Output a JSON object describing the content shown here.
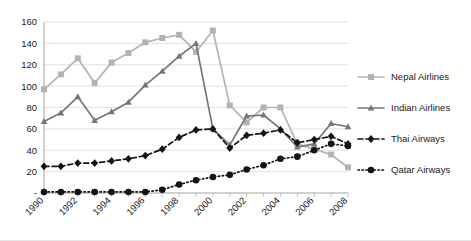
{
  "chart_data": {
    "type": "line",
    "title": "",
    "subtitle": "",
    "xlabel": "",
    "ylabel": "",
    "x": [
      1990,
      1991,
      1992,
      1993,
      1994,
      1995,
      1996,
      1997,
      1998,
      1999,
      2000,
      2001,
      2002,
      2003,
      2004,
      2005,
      2006,
      2007,
      2008
    ],
    "tick_labels": [
      "1990",
      "1992",
      "1994",
      "1996",
      "1998",
      "2000",
      "2002",
      "2004",
      "2006",
      "2008"
    ],
    "ytick_labels": [
      "-",
      "20",
      "40",
      "60",
      "80",
      "100",
      "120",
      "140",
      "160"
    ],
    "ylim": [
      0,
      160
    ],
    "xlim": [
      1990,
      2008
    ],
    "grid": true,
    "legend_position": "right",
    "series": [
      {
        "name": "Nepal Airlines",
        "color": "#b3b3b3",
        "marker": "square",
        "dash": "solid",
        "values": [
          97,
          111,
          126,
          103,
          122,
          131,
          141,
          145,
          148,
          132,
          152,
          82,
          66,
          80,
          80,
          46,
          41,
          36,
          24
        ]
      },
      {
        "name": "Indian Airlines",
        "color": "#767676",
        "marker": "triangle",
        "dash": "solid",
        "values": [
          67,
          75,
          90,
          68,
          76,
          85,
          101,
          114,
          128,
          140,
          60,
          45,
          72,
          73,
          60,
          43,
          46,
          65,
          62
        ]
      },
      {
        "name": "Thai Airways",
        "color": "#141414",
        "marker": "diamond",
        "dash": "dashed",
        "values": [
          25,
          25,
          28,
          28,
          30,
          32,
          35,
          41,
          52,
          59,
          60,
          42,
          54,
          56,
          59,
          47,
          50,
          53,
          46
        ]
      },
      {
        "name": "Qatar Airways",
        "color": "#141414",
        "marker": "circle",
        "dash": "dotted",
        "values": [
          1,
          1,
          1,
          1,
          1,
          1,
          1,
          3,
          8,
          12,
          15,
          17,
          22,
          26,
          32,
          34,
          40,
          46,
          44
        ]
      }
    ]
  }
}
